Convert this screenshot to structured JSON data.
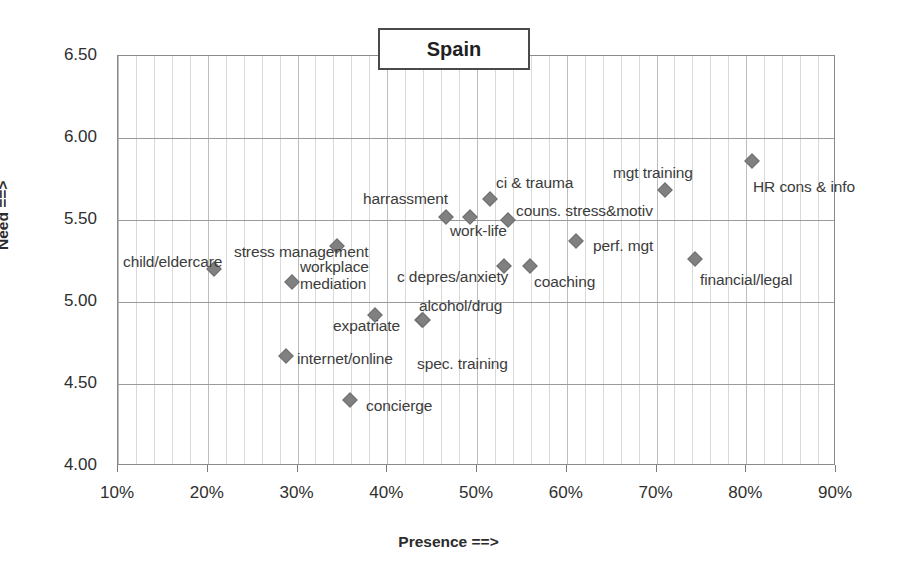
{
  "chart_data": {
    "type": "scatter",
    "title": "Spain",
    "xlabel": "Presence ==>",
    "ylabel": "Need ==>",
    "xlim": [
      10,
      90
    ],
    "ylim": [
      4.0,
      6.5
    ],
    "xunit": "%",
    "grid": true,
    "legend": "none",
    "xticks": [
      "10%",
      "20%",
      "30%",
      "40%",
      "50%",
      "60%",
      "70%",
      "80%",
      "90%"
    ],
    "xtick_values": [
      10,
      20,
      30,
      40,
      50,
      60,
      70,
      80,
      90
    ],
    "yticks": [
      "4.00",
      "4.50",
      "5.00",
      "5.50",
      "6.00",
      "6.50"
    ],
    "ytick_values": [
      4.0,
      4.5,
      5.0,
      5.5,
      6.0,
      6.5
    ],
    "marker_color": "#808080",
    "marker_shape": "diamond",
    "points": [
      {
        "label": "child/eldercare",
        "x": 20.7,
        "y": 5.2,
        "lx": 123,
        "ly": 253,
        "align": "left"
      },
      {
        "label": "internet/online",
        "x": 28.7,
        "y": 4.67,
        "lx": 297,
        "ly": 350,
        "align": "left"
      },
      {
        "label": "workplace mediation",
        "x": 29.4,
        "y": 5.12,
        "lx": 300,
        "ly": 258,
        "align": "left"
      },
      {
        "label": "stress management",
        "x": 34.4,
        "y": 5.34,
        "lx": 234,
        "ly": 243,
        "align": "left"
      },
      {
        "label": "concierge",
        "x": 35.9,
        "y": 4.4,
        "lx": 366,
        "ly": 397,
        "align": "left"
      },
      {
        "label": "expatriate",
        "x": 38.6,
        "y": 4.92,
        "lx": 333,
        "ly": 317,
        "align": "left"
      },
      {
        "label": "spec. training",
        "x": 43.9,
        "y": 4.89,
        "lx": 417,
        "ly": 355,
        "align": "left"
      },
      {
        "label": "alcohol/drug",
        "x": 44.0,
        "y": 4.89,
        "lx": 419,
        "ly": 297,
        "align": "left"
      },
      {
        "label": "harrassment",
        "x": 46.5,
        "y": 5.52,
        "lx": 363,
        "ly": 190,
        "align": "left"
      },
      {
        "label": "work-life",
        "x": 49.2,
        "y": 5.52,
        "lx": 450,
        "ly": 222,
        "align": "left"
      },
      {
        "label": "c depres/anxiety",
        "x": 53.0,
        "y": 5.22,
        "lx": 397,
        "ly": 268,
        "align": "left"
      },
      {
        "label": "ci & trauma",
        "x": 51.4,
        "y": 5.63,
        "lx": 496,
        "ly": 174,
        "align": "left"
      },
      {
        "label": "couns. stress&motiv",
        "x": 53.5,
        "y": 5.5,
        "lx": 516,
        "ly": 202,
        "align": "left"
      },
      {
        "label": "coaching",
        "x": 55.9,
        "y": 5.22,
        "lx": 534,
        "ly": 273,
        "align": "left"
      },
      {
        "label": "perf. mgt",
        "x": 61.0,
        "y": 5.37,
        "lx": 593,
        "ly": 237,
        "align": "left"
      },
      {
        "label": "mgt training",
        "x": 70.9,
        "y": 5.68,
        "lx": 613,
        "ly": 164,
        "align": "left"
      },
      {
        "label": "financial/legal",
        "x": 74.3,
        "y": 5.26,
        "lx": 700,
        "ly": 271,
        "align": "left"
      },
      {
        "label": "HR cons & info",
        "x": 80.6,
        "y": 5.86,
        "lx": 753,
        "ly": 178,
        "align": "left"
      }
    ]
  }
}
